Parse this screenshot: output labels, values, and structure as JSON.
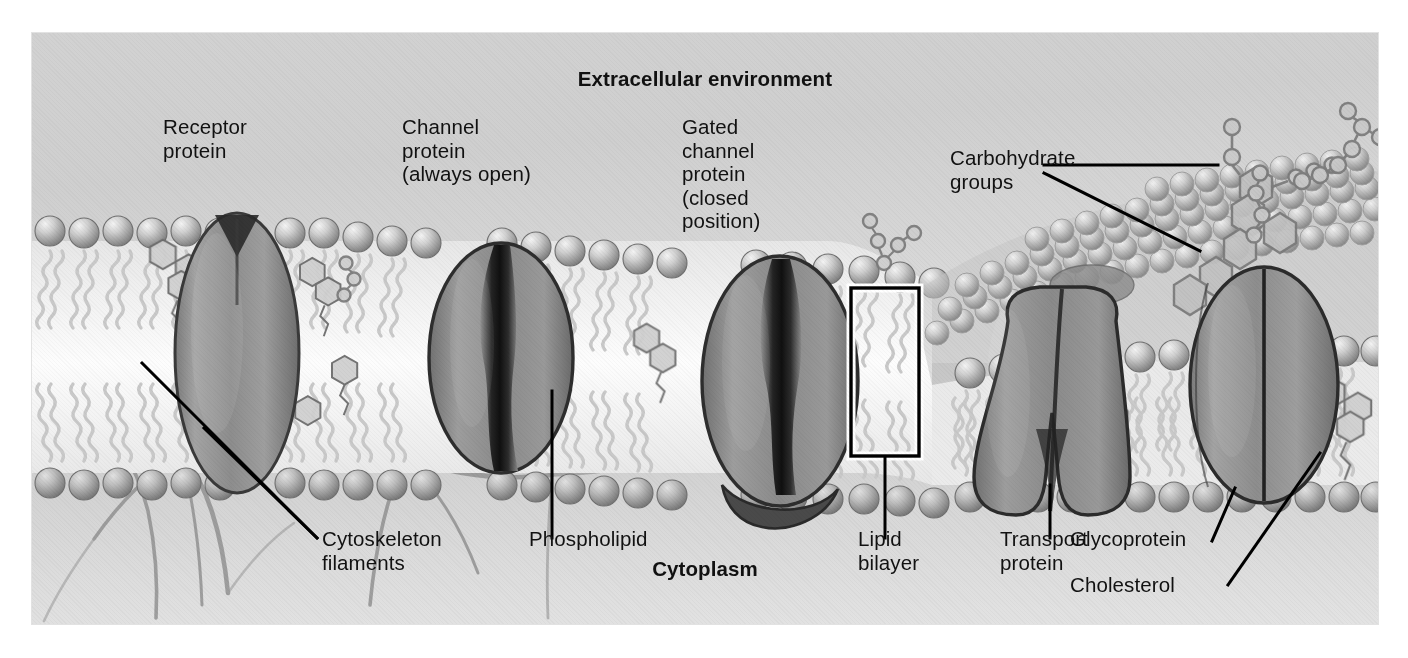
{
  "figure": {
    "kind": "biology-diagram",
    "background_color": "#d8d8d8",
    "text_color": "#111111"
  },
  "headings": {
    "top": "Extracellular environment",
    "bottom": "Cytoplasm"
  },
  "labels": {
    "receptor_protein": "Receptor\nprotein",
    "channel_protein": "Channel\nprotein\n(always open)",
    "gated_channel_protein": "Gated\nchannel\nprotein\n(closed\nposition)",
    "carbohydrate_groups": "Carbohydrate\ngroups",
    "cytoskeleton_filaments": "Cytoskeleton\nfilaments",
    "phospholipid": "Phospholipid",
    "lipid_bilayer": "Lipid\nbilayer",
    "transport_protein": "Transport\nprotein",
    "glycoprotein": "Glycoprotein",
    "cholesterol": "Cholesterol"
  },
  "structures": [
    {
      "name": "receptor-protein",
      "shape": "oval",
      "note": "spans bilayer, notch at top"
    },
    {
      "name": "channel-protein",
      "shape": "oval",
      "note": "open pore down center"
    },
    {
      "name": "gated-channel-protein",
      "shape": "oval",
      "note": "pore closed, gate flap at cytoplasmic face"
    },
    {
      "name": "transport-protein",
      "shape": "funnel",
      "note": "narrow outside, flared into cytoplasm"
    },
    {
      "name": "glycoprotein",
      "shape": "oval",
      "note": "carbohydrate chain attached on outer face"
    },
    {
      "name": "phospholipid",
      "shape": "sphere-head-two-tails"
    },
    {
      "name": "cholesterol",
      "shape": "fused-ring",
      "note": "wedged between phospholipid tails"
    },
    {
      "name": "carbohydrate-group",
      "shape": "hexagon-chain"
    },
    {
      "name": "cytoskeleton-filament",
      "shape": "fiber-network"
    }
  ],
  "callout": {
    "lipid_bilayer_box": "highlight rectangle around one phospholipid pair"
  }
}
